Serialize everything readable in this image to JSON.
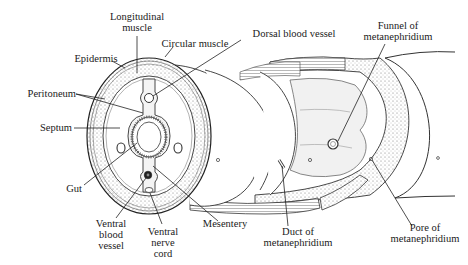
{
  "figure": {
    "colors": {
      "ink": "#1a1a1a",
      "stipple": "#9a9a9a",
      "background": "#ffffff"
    }
  },
  "labels": {
    "longitudinal_muscle": [
      "Longitudinal",
      "muscle"
    ],
    "circular_muscle": "Circular muscle",
    "dorsal_blood_vessel": "Dorsal blood vessel",
    "funnel": [
      "Funnel of",
      "metanephridium"
    ],
    "epidermis": "Epidermis",
    "peritoneum": "Peritoneum",
    "septum": "Septum",
    "gut": "Gut",
    "ventral_blood_vessel": [
      "Ventral",
      "blood",
      "vessel"
    ],
    "ventral_nerve_cord": [
      "Ventral",
      "nerve",
      "cord"
    ],
    "mesentery": "Mesentery",
    "duct": [
      "Duct of",
      "metanephridium"
    ],
    "pore": [
      "Pore of",
      "metanephridium"
    ]
  }
}
